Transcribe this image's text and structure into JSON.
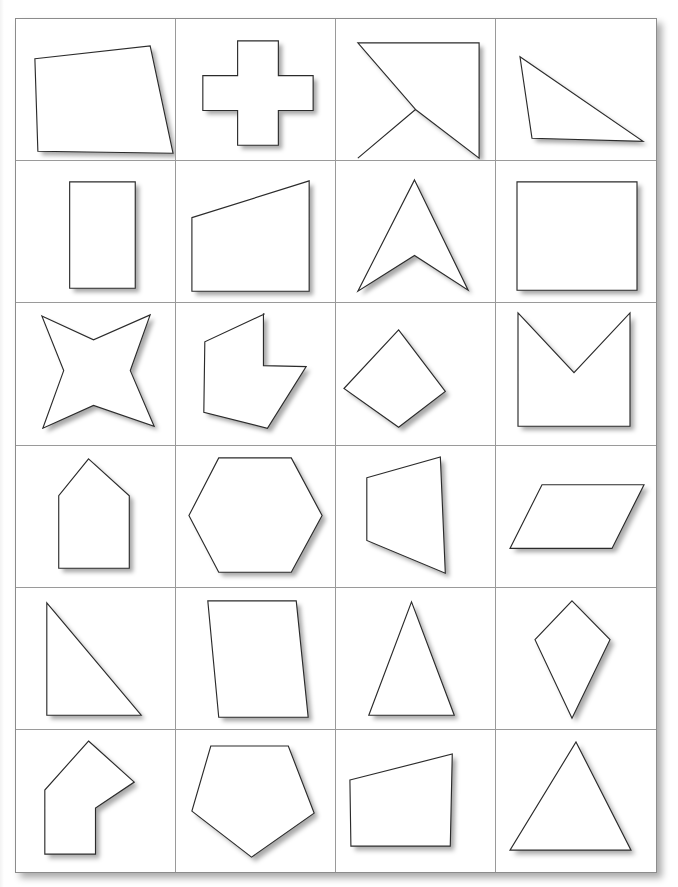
{
  "page": {
    "title_fragment": "",
    "background_color": "#ffffff",
    "sheet": {
      "border_color": "#8c8c8c",
      "grid_line_color": "#9a9a9a",
      "shape_stroke_color": "#2b2b2b",
      "shape_fill_color": "#ffffff",
      "shadow_color": "rgba(0,0,0,0.34)",
      "columns": 4,
      "rows": 6
    }
  },
  "shapes": [
    {
      "index": 1,
      "row": 1,
      "col": 1,
      "name": "irregular-quadrilateral",
      "sides": 4,
      "points": "19,40 135,27 158,135 22,133"
    },
    {
      "index": 2,
      "row": 1,
      "col": 2,
      "name": "cross-plus",
      "sides": 12,
      "points": "62,22 103,22 103,57 138,57 138,92 103,92 103,127 62,127 62,92 27,92 27,57 62,57"
    },
    {
      "index": 3,
      "row": 1,
      "col": 3,
      "name": "bowtie-hourglass",
      "sides": 6,
      "points": "22,24 144,24 144,140 80,91 22,140 80,91"
    },
    {
      "index": 4,
      "row": 1,
      "col": 4,
      "name": "obtuse-triangle",
      "sides": 3,
      "points": "24,38 147,123 36,120"
    },
    {
      "index": 5,
      "row": 2,
      "col": 1,
      "name": "vertical-rectangle",
      "sides": 4,
      "points": "54,21 120,21 120,128 54,128"
    },
    {
      "index": 6,
      "row": 2,
      "col": 2,
      "name": "right-trapezoid",
      "sides": 4,
      "points": "16,57 134,20 134,131 16,131"
    },
    {
      "index": 7,
      "row": 2,
      "col": 3,
      "name": "concave-arrowhead",
      "sides": 4,
      "points": "79,19 133,130 79,95 22,131"
    },
    {
      "index": 8,
      "row": 2,
      "col": 4,
      "name": "square",
      "sides": 4,
      "points": "21,21 141,21 141,130 21,130"
    },
    {
      "index": 9,
      "row": 3,
      "col": 1,
      "name": "four-pointed-star",
      "sides": 8,
      "points": "26,13 78,37 135,12 115,68 139,124 78,103 27,126 48,68"
    },
    {
      "index": 10,
      "row": 3,
      "col": 2,
      "name": "concave-hexagon-notched",
      "sides": 7,
      "points": "89,11 29,39 28,110 92,126 131,64 88,63 88,11"
    },
    {
      "index": 11,
      "row": 3,
      "col": 3,
      "name": "irregular-kite-quadrilateral",
      "sides": 4,
      "points": "63,27 110,89 63,125 8,86"
    },
    {
      "index": 12,
      "row": 3,
      "col": 4,
      "name": "square-with-v-notch",
      "sides": 5,
      "points": "22,10 78,70 134,10 134,124 22,124"
    },
    {
      "index": 13,
      "row": 4,
      "col": 1,
      "name": "house-pentagon",
      "sides": 5,
      "points": "73,13 114,50 114,123 43,123 43,50"
    },
    {
      "index": 14,
      "row": 4,
      "col": 2,
      "name": "hexagon",
      "sides": 6,
      "points": "43,12 116,12 147,70 116,127 43,127 13,70"
    },
    {
      "index": 15,
      "row": 4,
      "col": 3,
      "name": "trapezoid-right",
      "sides": 4,
      "points": "31,32 105,11 110,128 31,95"
    },
    {
      "index": 16,
      "row": 4,
      "col": 4,
      "name": "parallelogram",
      "sides": 4,
      "points": "46,39 148,39 116,103 14,103"
    },
    {
      "index": 17,
      "row": 5,
      "col": 1,
      "name": "right-triangle",
      "sides": 3,
      "points": "31,15 126,128 31,128"
    },
    {
      "index": 18,
      "row": 5,
      "col": 2,
      "name": "slanted-parallelogram",
      "sides": 4,
      "points": "32,13 121,13 133,130 43,130"
    },
    {
      "index": 19,
      "row": 5,
      "col": 3,
      "name": "isosceles-triangle",
      "sides": 3,
      "points": "76,14 119,128 33,128"
    },
    {
      "index": 20,
      "row": 5,
      "col": 4,
      "name": "kite-rhombus",
      "sides": 4,
      "points": "76,13 114,52 76,131 39,52"
    },
    {
      "index": 21,
      "row": 6,
      "col": 1,
      "name": "bent-arrow-hexagon",
      "sides": 6,
      "points": "73,11 119,52 80,78 80,124 29,124 29,60"
    },
    {
      "index": 22,
      "row": 6,
      "col": 2,
      "name": "pentagon",
      "sides": 5,
      "points": "35,16 113,16 139,83 76,127 16,81"
    },
    {
      "index": 23,
      "row": 6,
      "col": 3,
      "name": "irregular-trapezoid",
      "sides": 4,
      "points": "14,50 117,24 115,116 15,116"
    },
    {
      "index": 24,
      "row": 6,
      "col": 4,
      "name": "acute-triangle",
      "sides": 3,
      "points": "80,12 135,120 14,120"
    }
  ]
}
